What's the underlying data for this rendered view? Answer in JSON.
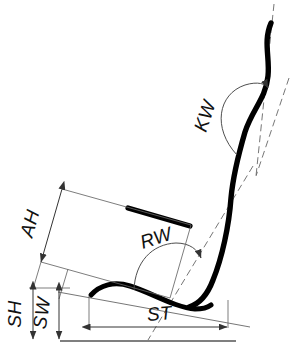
{
  "figure": {
    "type": "engineering-dimension-diagram",
    "background_color": "#ffffff",
    "outline_color": "#000000",
    "dimension_line_color": "#555555"
  },
  "labels": {
    "kw": "KW",
    "rw": "RW",
    "ah": "AH",
    "sh": "SH",
    "sw": "SW",
    "st": "ST"
  },
  "annotations": [
    {
      "id": "kw",
      "label": "KW",
      "kind": "angle",
      "description": "backrest top angle measured from vertical reference axis"
    },
    {
      "id": "rw",
      "label": "RW",
      "kind": "angle",
      "description": "backrest inclination angle measured from seat reference line"
    },
    {
      "id": "ah",
      "label": "AH",
      "kind": "linear",
      "description": "armrest height measured perpendicular to seat plane"
    },
    {
      "id": "sh",
      "label": "SH",
      "kind": "linear",
      "description": "seat height above ground reference line"
    },
    {
      "id": "sw",
      "label": "SW",
      "kind": "linear",
      "description": "seat surface height above ground reference line"
    },
    {
      "id": "st",
      "label": "ST",
      "kind": "linear",
      "description": "seat depth measured along seat reference line"
    }
  ],
  "geometry": {
    "backrest_curve": "M 270,24 C 262,46 272,64 268,84 C 264,108 248,118 243,140 C 236,168 232,186 230,210 C 228,238 216,270 208,288 C 202,300 196,304 188,306",
    "seat_curve": "M 92,294 C 104,284 118,282 134,288 C 156,296 186,310 208,308",
    "armrest_line": "M 128,208 L 190,226",
    "ground_line": {
      "x1": 60,
      "y1": 341,
      "x2": 236,
      "y2": 341
    },
    "vertical_ref_line": {
      "x1": 272,
      "y1": 6,
      "x2": 256,
      "y2": 172
    },
    "backrest_axis_line": {
      "x1": 246,
      "y1": 181,
      "x2": 148,
      "y2": 338
    },
    "seat_ref_line": {
      "x1": 60,
      "y1": 296,
      "x2": 248,
      "y2": 330
    }
  }
}
